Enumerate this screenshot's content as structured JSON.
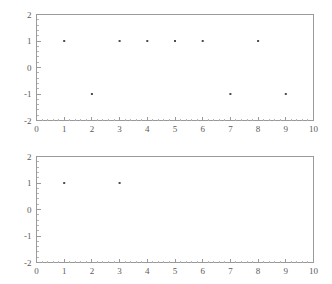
{
  "page": {
    "background_color": "#ffffff",
    "axis_color": "#9a9a9a",
    "point_color": "#4d4d4d",
    "label_color": "#5a5a5a"
  },
  "chart_data": [
    {
      "type": "scatter",
      "title": "",
      "subtitle": "",
      "xlabel": "",
      "ylabel": "",
      "xlim": [
        0,
        10
      ],
      "ylim": [
        -2,
        2
      ],
      "grid": false,
      "legend": null,
      "xticks": [
        0,
        1,
        2,
        3,
        4,
        5,
        6,
        7,
        8,
        9,
        10
      ],
      "xticklabels": [
        "0",
        "1",
        "2",
        "3",
        "4",
        "5",
        "6",
        "7",
        "8",
        "9",
        "10"
      ],
      "yticks": [
        -2,
        -1,
        0,
        1,
        2
      ],
      "yticklabels": [
        "-2",
        "-1",
        "0",
        "1",
        "2"
      ],
      "minor_x_per_major": 5,
      "minor_y_per_major": 5,
      "series": [
        {
          "name": "",
          "marker": "point",
          "x": [
            1,
            2,
            3,
            4,
            5,
            6,
            7,
            8,
            9
          ],
          "y": [
            1,
            -1,
            1,
            1,
            1,
            1,
            -1,
            1,
            -1
          ]
        }
      ]
    },
    {
      "type": "scatter",
      "title": "",
      "subtitle": "",
      "xlabel": "",
      "ylabel": "",
      "xlim": [
        0,
        10
      ],
      "ylim": [
        -2,
        2
      ],
      "grid": false,
      "legend": null,
      "xticks": [
        0,
        1,
        2,
        3,
        4,
        5,
        6,
        7,
        8,
        9,
        10
      ],
      "xticklabels": [
        "0",
        "1",
        "2",
        "3",
        "4",
        "5",
        "6",
        "7",
        "8",
        "9",
        "10"
      ],
      "yticks": [
        -2,
        -1,
        0,
        1,
        2
      ],
      "yticklabels": [
        "-2",
        "-1",
        "0",
        "1",
        "2"
      ],
      "minor_x_per_major": 5,
      "minor_y_per_major": 5,
      "series": [
        {
          "name": "",
          "marker": "point",
          "x": [
            1,
            3
          ],
          "y": [
            1,
            1
          ]
        }
      ]
    }
  ]
}
